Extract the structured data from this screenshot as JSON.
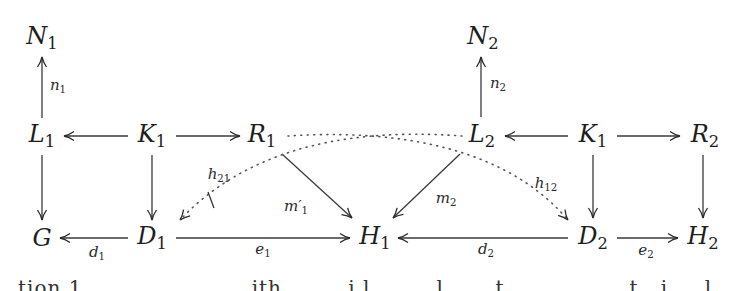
{
  "diagram": {
    "type": "commutative-diagram",
    "nodes": {
      "N1": {
        "base": "N",
        "sub": "1"
      },
      "L1": {
        "base": "L",
        "sub": "1"
      },
      "K1a": {
        "base": "K",
        "sub": "1"
      },
      "R1": {
        "base": "R",
        "sub": "1"
      },
      "G": {
        "base": "G",
        "sub": ""
      },
      "D1": {
        "base": "D",
        "sub": "1"
      },
      "H1": {
        "base": "H",
        "sub": "1"
      },
      "N2": {
        "base": "N",
        "sub": "2"
      },
      "L2": {
        "base": "L",
        "sub": "2"
      },
      "K1b": {
        "base": "K",
        "sub": "1"
      },
      "R2": {
        "base": "R",
        "sub": "2"
      },
      "D2": {
        "base": "D",
        "sub": "2"
      },
      "H2": {
        "base": "H",
        "sub": "2"
      }
    },
    "labels": {
      "n1": {
        "base": "n",
        "sub": "1"
      },
      "n2": {
        "base": "n",
        "sub": "2"
      },
      "d1": {
        "base": "d",
        "sub": "1"
      },
      "e1": {
        "base": "e",
        "sub": "1"
      },
      "d2": {
        "base": "d",
        "sub": "2"
      },
      "e2": {
        "base": "e",
        "sub": "2"
      },
      "m1p": {
        "base": "m′",
        "sub": "1"
      },
      "m2": {
        "base": "m",
        "sub": "2"
      },
      "h21": {
        "base": "h",
        "sub": "21"
      },
      "h12": {
        "base": "h",
        "sub": "12"
      }
    },
    "edges": [
      {
        "from": "L1",
        "to": "N1",
        "label": "n1",
        "style": "solid"
      },
      {
        "from": "K1a",
        "to": "L1",
        "style": "solid"
      },
      {
        "from": "K1a",
        "to": "R1",
        "style": "solid"
      },
      {
        "from": "L1",
        "to": "G",
        "style": "solid"
      },
      {
        "from": "K1a",
        "to": "D1",
        "style": "solid"
      },
      {
        "from": "D1",
        "to": "G",
        "label": "d1",
        "style": "solid"
      },
      {
        "from": "D1",
        "to": "H1",
        "label": "e1",
        "style": "solid"
      },
      {
        "from": "R1",
        "to": "H1",
        "label": "m1p",
        "style": "solid"
      },
      {
        "from": "L2",
        "to": "H1",
        "label": "m2",
        "style": "solid"
      },
      {
        "from": "L2",
        "to": "D1",
        "label": "h21",
        "style": "dotted",
        "negated": true
      },
      {
        "from": "R1",
        "to": "D2",
        "label": "h12",
        "style": "dotted"
      },
      {
        "from": "L2",
        "to": "N2",
        "label": "n2",
        "style": "solid"
      },
      {
        "from": "K1b",
        "to": "L2",
        "style": "solid"
      },
      {
        "from": "K1b",
        "to": "R2",
        "style": "solid"
      },
      {
        "from": "K1b",
        "to": "D2",
        "style": "solid"
      },
      {
        "from": "R2",
        "to": "H2",
        "style": "solid"
      },
      {
        "from": "D2",
        "to": "H1",
        "label": "d2",
        "style": "solid"
      },
      {
        "from": "D2",
        "to": "H2",
        "label": "e2",
        "style": "solid"
      }
    ],
    "colors": {
      "ink": "#1e1e1e",
      "background": "#ffffff"
    }
  },
  "caption": {
    "text": "tion 1 . . . . . . . . . . . ith . . . . i  l . . . . l . . . t . . . . . . . . t . i . . l . . . . . t . . f"
  }
}
